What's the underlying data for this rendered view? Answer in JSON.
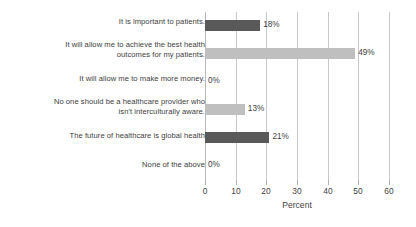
{
  "chart_data": {
    "type": "bar",
    "orientation": "horizontal",
    "title": "",
    "subtitle": "",
    "xlabel": "Percent",
    "ylabel": "",
    "xlim": [
      0,
      60
    ],
    "xticks": [
      0,
      10,
      20,
      30,
      40,
      50,
      60
    ],
    "xtick_labels": [
      "0",
      "10",
      "20",
      "30",
      "40",
      "50",
      "60"
    ],
    "grid": "vertical",
    "legend": "none",
    "categories": [
      "It is important to patients.",
      "It will allow me to achieve the best health\noutcomes for my patients.",
      "It will allow me to make more money.",
      "No one should be a healthcare provider who\nisn't interculturally aware.",
      "The future of healthcare is global health",
      "None of the above"
    ],
    "values": [
      18,
      49,
      0,
      13,
      21,
      0
    ],
    "data_labels": [
      "18%",
      "49%",
      "0%",
      "13%",
      "21%",
      "0%"
    ],
    "bar_colors": [
      "#595959",
      "#bfbfbf",
      "#bfbfbf",
      "#bfbfbf",
      "#595959",
      "#595959"
    ],
    "colors": {
      "dark_bar": "#595959",
      "light_bar": "#bfbfbf",
      "gridline": "#c8c8c8",
      "text": "#3f3f3f",
      "background": "#ffffff"
    }
  }
}
